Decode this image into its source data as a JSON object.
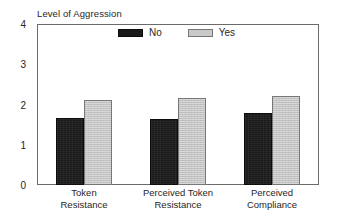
{
  "chart_data": {
    "type": "bar",
    "title": "Level of Aggression",
    "xlabel": "",
    "ylabel": "",
    "ylim": [
      0,
      4
    ],
    "yticks": [
      "0",
      "1",
      "2",
      "3",
      "4"
    ],
    "grid": false,
    "legend_position": "top-center",
    "categories": [
      [
        "Token",
        "Resistance"
      ],
      [
        "Perceived Token",
        "Resistance"
      ],
      [
        "Perceived",
        "Compliance"
      ]
    ],
    "category_labels": [
      "Token Resistance",
      "Perceived Token Resistance",
      "Perceived Compliance"
    ],
    "series": [
      {
        "name": "No",
        "color": "#1a1a1a",
        "values": [
          1.67,
          1.65,
          1.8
        ]
      },
      {
        "name": "Yes",
        "color": "#c9c9c9",
        "values": [
          2.1,
          2.17,
          2.22
        ]
      }
    ]
  },
  "legend": {
    "items": [
      {
        "label": "No",
        "swatch": "black-square-swatch"
      },
      {
        "label": "Yes",
        "swatch": "gray-square-swatch"
      }
    ]
  },
  "axes": {
    "y_tick_labels": [
      "4",
      "3",
      "2",
      "1",
      "0"
    ]
  }
}
